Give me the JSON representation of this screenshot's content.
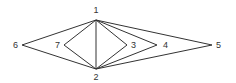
{
  "diagram": {
    "type": "graph",
    "nodes": [
      {
        "id": "1",
        "label": "1",
        "x": 96,
        "y": 20,
        "lx": 96,
        "ly": 13,
        "anchor": "middle"
      },
      {
        "id": "2",
        "label": "2",
        "x": 96,
        "y": 69,
        "lx": 96,
        "ly": 80,
        "anchor": "middle"
      },
      {
        "id": "3",
        "label": "3",
        "x": 127,
        "y": 45,
        "lx": 131,
        "ly": 48,
        "anchor": "start"
      },
      {
        "id": "4",
        "label": "4",
        "x": 157,
        "y": 45,
        "lx": 163,
        "ly": 48,
        "anchor": "start"
      },
      {
        "id": "5",
        "label": "5",
        "x": 212,
        "y": 45,
        "lx": 216,
        "ly": 48,
        "anchor": "start"
      },
      {
        "id": "6",
        "label": "6",
        "x": 22,
        "y": 45,
        "lx": 18,
        "ly": 48,
        "anchor": "end"
      },
      {
        "id": "7",
        "label": "7",
        "x": 64,
        "y": 45,
        "lx": 60,
        "ly": 48,
        "anchor": "end"
      }
    ],
    "edges": [
      [
        "1",
        "2"
      ],
      [
        "1",
        "3"
      ],
      [
        "2",
        "3"
      ],
      [
        "1",
        "4"
      ],
      [
        "2",
        "4"
      ],
      [
        "1",
        "5"
      ],
      [
        "2",
        "5"
      ],
      [
        "1",
        "6"
      ],
      [
        "2",
        "6"
      ],
      [
        "1",
        "7"
      ],
      [
        "2",
        "7"
      ]
    ],
    "colors": {
      "stroke": "#333333",
      "background": "#ffffff"
    }
  }
}
